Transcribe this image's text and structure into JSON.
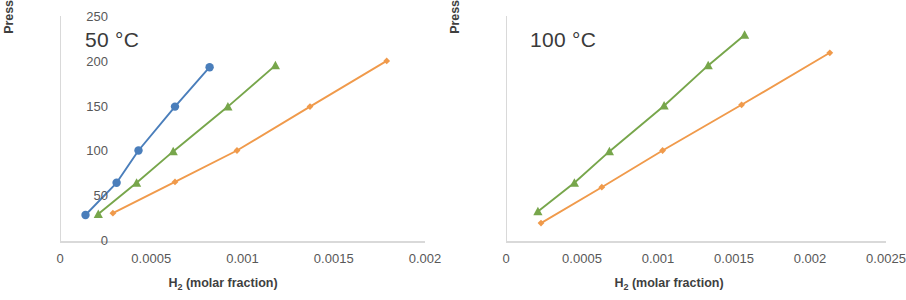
{
  "figure": {
    "axis_color": "#d9d9d9",
    "tick_text_color": "#585858",
    "label_text_color": "#3f3f3f"
  },
  "series_colors": {
    "blue": "#4A7EBB",
    "green": "#77A64B",
    "orange": "#F09A4B"
  },
  "panels": [
    {
      "id": "panel-50c",
      "title": "50 °C",
      "ylabel": "Pressure (bar)",
      "xlabel_main": "H",
      "xlabel_sub": "2",
      "xlabel_rest": " (molar fraction)",
      "yticks": [
        "0",
        "50",
        "100",
        "150",
        "200",
        "250"
      ],
      "xticks": [
        "0",
        "0.0005",
        "0.001",
        "0.0015",
        "0.002"
      ]
    },
    {
      "id": "panel-100c",
      "title": "100 °C",
      "ylabel": "Pressure (bar)",
      "xlabel_main": "H",
      "xlabel_sub": "2",
      "xlabel_rest": " (molar fraction)",
      "yticks": [
        "0",
        "50",
        "100",
        "150",
        "200",
        "250"
      ],
      "xticks": [
        "0",
        "0.0005",
        "0.001",
        "0.0015",
        "0.002",
        "0.0025"
      ]
    }
  ],
  "chart_data": [
    {
      "type": "scatter",
      "title": "50 °C",
      "xlabel": "H2 (molar fraction)",
      "ylabel": "Pressure (bar)",
      "xlim": [
        0,
        0.002
      ],
      "ylim": [
        0,
        250
      ],
      "xticks": [
        0,
        0.0005,
        0.001,
        0.0015,
        0.002
      ],
      "yticks": [
        0,
        50,
        100,
        150,
        200,
        250
      ],
      "grid": false,
      "legend": "none",
      "series": [
        {
          "name": "blue",
          "color": "#4A7EBB",
          "marker": "circle",
          "x": [
            0.00014,
            0.00031,
            0.00043,
            0.00063,
            0.00082
          ],
          "y": [
            29,
            65,
            101,
            150,
            194
          ]
        },
        {
          "name": "green",
          "color": "#77A64B",
          "marker": "triangle",
          "x": [
            0.00021,
            0.00042,
            0.00062,
            0.00092,
            0.00118
          ],
          "y": [
            30,
            65,
            100,
            150,
            196
          ]
        },
        {
          "name": "orange",
          "color": "#F09A4B",
          "marker": "diamond",
          "x": [
            0.00029,
            0.00063,
            0.00097,
            0.00137,
            0.00179
          ],
          "y": [
            31,
            66,
            101,
            150,
            201
          ]
        }
      ]
    },
    {
      "type": "scatter",
      "title": "100 °C",
      "xlabel": "H2 (molar fraction)",
      "ylabel": "Pressure (bar)",
      "xlim": [
        0,
        0.0025
      ],
      "ylim": [
        0,
        250
      ],
      "xticks": [
        0,
        0.0005,
        0.001,
        0.0015,
        0.002,
        0.0025
      ],
      "yticks": [
        0,
        50,
        100,
        150,
        200,
        250
      ],
      "grid": false,
      "legend": "none",
      "series": [
        {
          "name": "green",
          "color": "#77A64B",
          "marker": "triangle",
          "x": [
            0.00021,
            0.00045,
            0.00068,
            0.00104,
            0.00133,
            0.00157
          ],
          "y": [
            33,
            65,
            100,
            151,
            196,
            230
          ]
        },
        {
          "name": "orange",
          "color": "#F09A4B",
          "marker": "diamond",
          "x": [
            0.00023,
            0.00063,
            0.00103,
            0.00155,
            0.00213
          ],
          "y": [
            20,
            60,
            101,
            152,
            210
          ]
        }
      ]
    }
  ]
}
